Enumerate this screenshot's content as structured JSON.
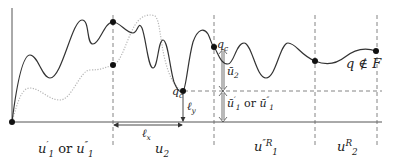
{
  "diagram": {
    "regions": [
      {
        "id": "r1",
        "label": "u'1 or u''1",
        "parts": {
          "a": "u",
          "a_sup": "′",
          "a_sub": "1",
          "or": "or",
          "b": "u",
          "b_sup": "″",
          "b_sub": "1"
        }
      },
      {
        "id": "r2",
        "label": "u2",
        "parts": {
          "a": "u",
          "a_sub": "2"
        }
      },
      {
        "id": "r3",
        "label": "u''R1",
        "parts": {
          "a": "u",
          "a_sup": "″R",
          "a_sub": "1"
        }
      },
      {
        "id": "r4",
        "label": "uR2",
        "parts": {
          "a": "u",
          "a_sup": "R",
          "a_sub": "2"
        }
      }
    ],
    "points": {
      "qc": {
        "base": "q",
        "sub": "c"
      },
      "qc_prime": {
        "base": "q",
        "sub": "c"
      },
      "end": {
        "text": "q ∉ F",
        "q": "q",
        "rel": "∉",
        "F": "F"
      }
    },
    "measures": {
      "lx": {
        "base": "ℓ",
        "sub": "x"
      },
      "ly": {
        "base": "ℓ",
        "sub": "y"
      },
      "ubar2": {
        "base": "ū",
        "sub": "2"
      },
      "ubar1": {
        "a": "ū",
        "a_sup": "′",
        "a_sub": "1",
        "or": "or",
        "b": "ū",
        "b_sup": "″",
        "b_sub": "1"
      }
    },
    "colors": {
      "curve": "#333333",
      "dotted_curve": "#b0b0b0",
      "axis": "#555555",
      "dashed": "#666666"
    }
  }
}
